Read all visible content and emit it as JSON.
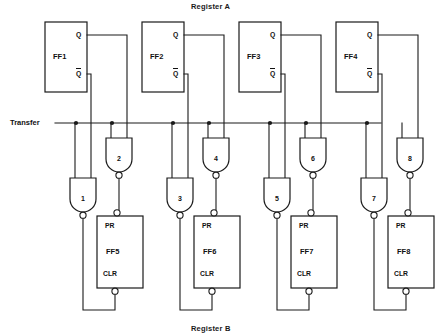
{
  "diagram": {
    "title_top": "Register A",
    "title_bottom": "Register B",
    "transfer_label": "Transfer",
    "stroke_color": "#1a1a1a",
    "background": "#ffffff"
  },
  "register_a": {
    "flipflops": [
      {
        "name": "FF1",
        "q": "Q",
        "qbar": "Q",
        "x": 45,
        "y": 22,
        "w": 42,
        "h": 70
      },
      {
        "name": "FF2",
        "q": "Q",
        "qbar": "Q",
        "x": 142,
        "y": 22,
        "w": 42,
        "h": 70
      },
      {
        "name": "FF3",
        "q": "Q",
        "qbar": "Q",
        "x": 239,
        "y": 22,
        "w": 42,
        "h": 70
      },
      {
        "name": "FF4",
        "q": "Q",
        "qbar": "Q",
        "x": 336,
        "y": 22,
        "w": 42,
        "h": 70
      }
    ]
  },
  "register_b": {
    "flipflops": [
      {
        "name": "FF5",
        "pr": "PR",
        "clr": "CLR",
        "x": 97,
        "y": 216,
        "w": 46,
        "h": 72
      },
      {
        "name": "FF6",
        "pr": "PR",
        "clr": "CLR",
        "x": 194,
        "y": 216,
        "w": 46,
        "h": 72
      },
      {
        "name": "FF7",
        "pr": "PR",
        "clr": "CLR",
        "x": 291,
        "y": 216,
        "w": 46,
        "h": 72
      },
      {
        "name": "FF8",
        "pr": "PR",
        "clr": "CLR",
        "x": 388,
        "y": 216,
        "w": 46,
        "h": 72
      }
    ]
  },
  "gates": [
    {
      "label": "1",
      "type": "nand",
      "cx": 83,
      "top": 178,
      "to": "clr"
    },
    {
      "label": "2",
      "type": "nand",
      "cx": 119,
      "top": 138,
      "to": "pr"
    },
    {
      "label": "3",
      "type": "nand",
      "cx": 180,
      "top": 178,
      "to": "clr"
    },
    {
      "label": "4",
      "type": "nand",
      "cx": 216,
      "top": 138,
      "to": "pr"
    },
    {
      "label": "5",
      "type": "nand",
      "cx": 277,
      "top": 178,
      "to": "clr"
    },
    {
      "label": "6",
      "type": "nand",
      "cx": 313,
      "top": 138,
      "to": "pr"
    },
    {
      "label": "7",
      "type": "nand",
      "cx": 374,
      "top": 178,
      "to": "clr"
    },
    {
      "label": "8",
      "type": "nand",
      "cx": 410,
      "top": 138,
      "to": "pr"
    }
  ],
  "transfer_bus": {
    "y": 123,
    "x_start": 55,
    "x_end": 381,
    "junction_dots": [
      76,
      112,
      173,
      209,
      270,
      306,
      367
    ]
  }
}
